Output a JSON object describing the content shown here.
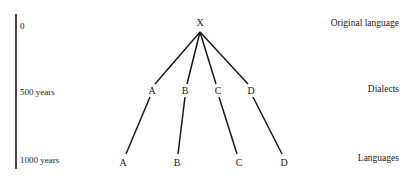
{
  "timeline": {
    "ticks": [
      {
        "label": "0"
      },
      {
        "label": "500 years"
      },
      {
        "label": "1000 years"
      }
    ]
  },
  "levels": {
    "original": "Original language",
    "dialects": "Dialects",
    "languages": "Languages"
  },
  "tree": {
    "root": "X",
    "dialects": [
      "A",
      "B",
      "C",
      "D"
    ],
    "languages": [
      "A",
      "B",
      "C",
      "D"
    ]
  },
  "colors": {
    "line": "#1a1a1a",
    "text": "#222222",
    "background": "#ffffff"
  }
}
